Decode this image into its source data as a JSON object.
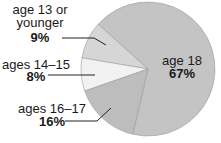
{
  "chart_data": {
    "type": "pie",
    "title": "",
    "slices": [
      {
        "label": "age 18",
        "value": 67,
        "value_label": "67%",
        "color": "#c4c4c4"
      },
      {
        "label": "age 13 or younger",
        "value": 9,
        "value_label": "9%",
        "color": "#d6d6d6"
      },
      {
        "label": "ages 14–15",
        "value": 8,
        "value_label": "8%",
        "color": "#f2f2f2"
      },
      {
        "label": "ages 16–17",
        "value": 16,
        "value_label": "16%",
        "color": "#bdbdbd"
      }
    ],
    "label_lines": {
      "age_13": [
        "age 13 or",
        "younger"
      ],
      "ages_14_15": [
        "ages 14–15"
      ],
      "ages_16_17": [
        "ages 16–17"
      ],
      "age_18": [
        "age 18"
      ]
    },
    "legend": "none",
    "labels_placement": "outside-left with leader lines; largest slice labeled inside"
  }
}
